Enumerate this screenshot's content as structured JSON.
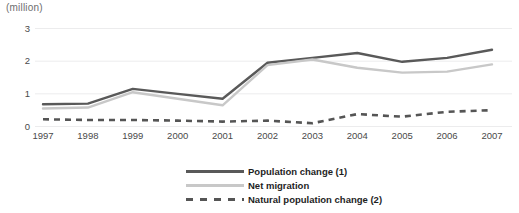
{
  "chart_data": {
    "type": "line",
    "title": "",
    "subtitle": "",
    "xlabel": "",
    "ylabel": "(million)",
    "unit_label": "(million)",
    "categories": [
      "1997",
      "1998",
      "1999",
      "2000",
      "2001",
      "2002",
      "2003",
      "2004",
      "2005",
      "2006",
      "2007"
    ],
    "x": [
      1997,
      1998,
      1999,
      2000,
      2001,
      2002,
      2003,
      2004,
      2005,
      2006,
      2007
    ],
    "ylim": [
      0,
      3
    ],
    "yticks": [
      0,
      1,
      2,
      3
    ],
    "ytick_labels": [
      "0",
      "1",
      "2",
      "3"
    ],
    "grid": true,
    "legend_position": "bottom-center",
    "series": [
      {
        "name": "Population change (1)",
        "style": "solid",
        "color": "#595959",
        "values": [
          0.68,
          0.7,
          1.15,
          1.0,
          0.85,
          1.95,
          2.1,
          2.25,
          1.98,
          2.1,
          2.35
        ]
      },
      {
        "name": "Net migration",
        "style": "solid",
        "color": "#c8c8c8",
        "values": [
          0.55,
          0.58,
          1.05,
          0.85,
          0.65,
          1.88,
          2.05,
          1.8,
          1.65,
          1.68,
          1.9
        ]
      },
      {
        "name": "Natural population change (2)",
        "style": "dashed",
        "color": "#555555",
        "values": [
          0.22,
          0.2,
          0.2,
          0.18,
          0.15,
          0.18,
          0.1,
          0.38,
          0.3,
          0.45,
          0.5
        ]
      }
    ]
  },
  "legend": {
    "items": [
      {
        "label": "Population change (1)",
        "color": "#595959",
        "style": "solid"
      },
      {
        "label": "Net migration",
        "color": "#c8c8c8",
        "style": "solid"
      },
      {
        "label": "Natural population change (2)",
        "color": "#555555",
        "style": "dashed"
      }
    ]
  },
  "axis": {
    "unit": "(million)",
    "y_labels": [
      "3",
      "2",
      "1",
      "0"
    ],
    "x_labels": [
      "1997",
      "1998",
      "1999",
      "2000",
      "2001",
      "2002",
      "2003",
      "2004",
      "2005",
      "2006",
      "2007"
    ]
  }
}
